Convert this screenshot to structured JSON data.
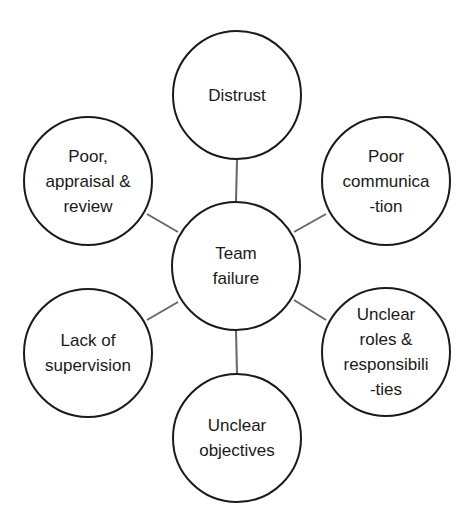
{
  "diagram": {
    "type": "hub-and-spoke",
    "center": {
      "label": "Team\nfailure",
      "cx": 236,
      "cy": 266
    },
    "nodes": [
      {
        "id": "distrust",
        "label": "Distrust",
        "cx": 237,
        "cy": 95
      },
      {
        "id": "poor-communication",
        "label": "Poor\ncommunica\n-tion",
        "cx": 386,
        "cy": 181
      },
      {
        "id": "unclear-roles",
        "label": "Unclear\nroles &\nresponsibili\n-ties",
        "cx": 386,
        "cy": 352
      },
      {
        "id": "unclear-objectives",
        "label": "Unclear\nobjectives",
        "cx": 237,
        "cy": 438
      },
      {
        "id": "lack-of-supervision",
        "label": "Lack of\nsupervision",
        "cx": 88,
        "cy": 353
      },
      {
        "id": "poor-appraisal",
        "label": "Poor,\nappraisal &\nreview",
        "cx": 88,
        "cy": 181
      }
    ],
    "colors": {
      "stroke": "#1a1a1a",
      "connector": "#666666",
      "fill": "#ffffff"
    }
  }
}
